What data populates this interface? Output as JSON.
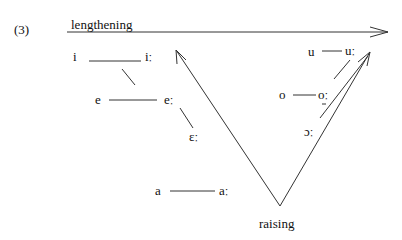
{
  "example_number": "(3)",
  "labels": {
    "top_arrow": "lengthening",
    "bottom": "raising"
  },
  "front_vowels": [
    {
      "short": "i",
      "long": "iː"
    },
    {
      "short": "e",
      "long": "eː"
    },
    {
      "long_only": "ɛː"
    }
  ],
  "back_vowels": [
    {
      "short": "u",
      "long": "uː"
    },
    {
      "short": "o",
      "long": "oː"
    },
    {
      "long_only": "ɔː"
    }
  ],
  "low_vowel": {
    "short": "a",
    "long": "aː"
  }
}
